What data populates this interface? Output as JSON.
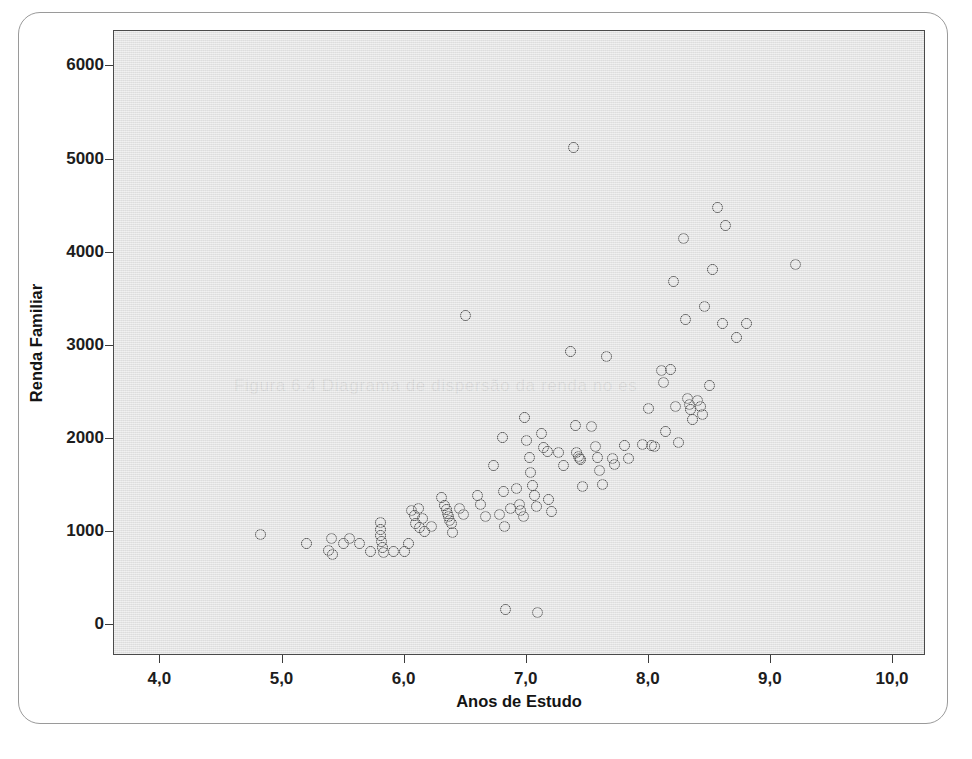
{
  "figure": {
    "background_color": "#ffffff",
    "panel_color": "#e2e2e2",
    "marker_color": "#4c4c4c",
    "ghost_text": "Figura 6.4  Diagrama de dispersão da renda no es"
  },
  "chart_data": {
    "type": "scatter",
    "title": "",
    "xlabel": "Anos de Estudo",
    "ylabel": "Renda Familiar",
    "xlim": [
      3.62,
      10.27
    ],
    "ylim": [
      -330,
      6380
    ],
    "grid": false,
    "legend": false,
    "xticks": [
      4.0,
      5.0,
      6.0,
      7.0,
      8.0,
      9.0,
      10.0
    ],
    "xtick_labels": [
      "4,0",
      "5,0",
      "6,0",
      "7,0",
      "8,0",
      "9,0",
      "10,0"
    ],
    "yticks": [
      0,
      1000,
      2000,
      3000,
      4000,
      5000,
      6000
    ],
    "ytick_labels": [
      "0",
      "1000",
      "2000",
      "3000",
      "4000",
      "5000",
      "6000"
    ],
    "marker": "open-circle",
    "n_points": 122,
    "points": [
      [
        4.82,
        975
      ],
      [
        5.2,
        880
      ],
      [
        5.38,
        800
      ],
      [
        5.4,
        930
      ],
      [
        5.41,
        760
      ],
      [
        5.5,
        880
      ],
      [
        5.55,
        930
      ],
      [
        5.63,
        880
      ],
      [
        5.72,
        790
      ],
      [
        5.8,
        1100
      ],
      [
        5.8,
        1030
      ],
      [
        5.8,
        960
      ],
      [
        5.81,
        900
      ],
      [
        5.82,
        840
      ],
      [
        5.83,
        780
      ],
      [
        5.91,
        790
      ],
      [
        6.0,
        790
      ],
      [
        6.03,
        880
      ],
      [
        6.06,
        1230
      ],
      [
        6.08,
        1180
      ],
      [
        6.09,
        1090
      ],
      [
        6.11,
        1250
      ],
      [
        6.12,
        1050
      ],
      [
        6.15,
        1150
      ],
      [
        6.16,
        1010
      ],
      [
        6.22,
        1060
      ],
      [
        6.3,
        1370
      ],
      [
        6.33,
        1285
      ],
      [
        6.34,
        1240
      ],
      [
        6.35,
        1205
      ],
      [
        6.36,
        1170
      ],
      [
        6.37,
        1130
      ],
      [
        6.38,
        1095
      ],
      [
        6.39,
        1000
      ],
      [
        6.45,
        1250
      ],
      [
        6.48,
        1190
      ],
      [
        6.5,
        3330
      ],
      [
        6.6,
        1390
      ],
      [
        6.62,
        1300
      ],
      [
        6.66,
        1170
      ],
      [
        6.73,
        1720
      ],
      [
        6.78,
        1185
      ],
      [
        6.8,
        2020
      ],
      [
        6.81,
        1440
      ],
      [
        6.82,
        1060
      ],
      [
        6.83,
        170
      ],
      [
        6.87,
        1255
      ],
      [
        6.92,
        1470
      ],
      [
        6.94,
        1300
      ],
      [
        6.95,
        1230
      ],
      [
        6.97,
        1170
      ],
      [
        6.98,
        2230
      ],
      [
        7.0,
        1985
      ],
      [
        7.02,
        1800
      ],
      [
        7.03,
        1640
      ],
      [
        7.05,
        1500
      ],
      [
        7.06,
        1395
      ],
      [
        7.08,
        1275
      ],
      [
        7.09,
        140
      ],
      [
        7.12,
        2060
      ],
      [
        7.14,
        1910
      ],
      [
        7.17,
        1870
      ],
      [
        7.18,
        1345
      ],
      [
        7.2,
        1220
      ],
      [
        7.26,
        1860
      ],
      [
        7.3,
        1720
      ],
      [
        7.36,
        2940
      ],
      [
        7.38,
        5130
      ],
      [
        7.4,
        2150
      ],
      [
        7.41,
        1850
      ],
      [
        7.42,
        1810
      ],
      [
        7.43,
        1795
      ],
      [
        7.44,
        1780
      ],
      [
        7.46,
        1490
      ],
      [
        7.53,
        2130
      ],
      [
        7.56,
        1915
      ],
      [
        7.58,
        1800
      ],
      [
        7.6,
        1660
      ],
      [
        7.62,
        1510
      ],
      [
        7.65,
        2890
      ],
      [
        7.7,
        1790
      ],
      [
        7.72,
        1725
      ],
      [
        7.8,
        1930
      ],
      [
        7.83,
        1790
      ],
      [
        7.95,
        1945
      ],
      [
        8.0,
        2330
      ],
      [
        8.02,
        1930
      ],
      [
        8.05,
        1915
      ],
      [
        8.1,
        2740
      ],
      [
        8.12,
        2605
      ],
      [
        8.14,
        2080
      ],
      [
        8.18,
        2745
      ],
      [
        8.2,
        3690
      ],
      [
        8.22,
        2345
      ],
      [
        8.24,
        1960
      ],
      [
        8.28,
        4150
      ],
      [
        8.3,
        3280
      ],
      [
        8.32,
        2430
      ],
      [
        8.33,
        2365
      ],
      [
        8.34,
        2320
      ],
      [
        8.36,
        2210
      ],
      [
        8.4,
        2410
      ],
      [
        8.42,
        2345
      ],
      [
        8.44,
        2260
      ],
      [
        8.46,
        3425
      ],
      [
        8.5,
        2575
      ],
      [
        8.52,
        3820
      ],
      [
        8.56,
        4480
      ],
      [
        8.6,
        3240
      ],
      [
        8.63,
        4295
      ],
      [
        8.72,
        3085
      ],
      [
        8.8,
        3240
      ],
      [
        9.2,
        3870
      ]
    ]
  },
  "axes": {
    "y_title": "Renda Familiar",
    "x_title": "Anos de Estudo"
  }
}
